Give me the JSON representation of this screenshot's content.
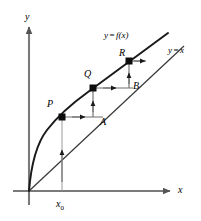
{
  "figure": {
    "background": "#ffffff",
    "stroke": "#1a1a1a",
    "axis_color": "#7a7a7a",
    "width": 201,
    "height": 221
  },
  "axes": {
    "x_label": "x",
    "y_label": "y",
    "origin": {
      "x": 29,
      "y": 191
    },
    "x_axis_end": {
      "x": 176,
      "y": 191
    },
    "y_axis_end": {
      "x": 29,
      "y": 23
    }
  },
  "curves": [
    {
      "name": "function-curve",
      "label": "y = f(x)",
      "label_lhs": "y",
      "label_eq": "=",
      "label_rhs": "f(x)",
      "label_pos": {
        "x": 104,
        "y": 31
      }
    },
    {
      "name": "identity-line",
      "label": "y = x",
      "label_lhs": "y",
      "label_eq": "=",
      "label_rhs": "x",
      "label_pos": {
        "x": 168,
        "y": 46
      }
    }
  ],
  "points": [
    {
      "id": "P",
      "label": "P",
      "dot": {
        "x": 62,
        "y": 117
      },
      "label_pos": {
        "x": 47,
        "y": 99
      }
    },
    {
      "id": "Q",
      "label": "Q",
      "dot": {
        "x": 93,
        "y": 88
      },
      "label_pos": {
        "x": 84,
        "y": 69
      }
    },
    {
      "id": "R",
      "label": "R",
      "dot": {
        "x": 129,
        "y": 61
      },
      "label_pos": {
        "x": 119,
        "y": 48
      }
    },
    {
      "id": "A",
      "label": "A",
      "dot": null,
      "label_pos": {
        "x": 100,
        "y": 117
      }
    },
    {
      "id": "B",
      "label": "B",
      "dot": null,
      "label_pos": {
        "x": 133,
        "y": 81
      }
    }
  ],
  "ticks": [
    {
      "id": "x0",
      "label": "x",
      "subscript": "0",
      "pos": {
        "x": 56,
        "y": 199
      },
      "gridline_x": 62
    }
  ],
  "iteration": {
    "description": "Vertical arrows to the curve, horizontal arrows to the line y = x",
    "segments": [
      {
        "from": "x0-axis",
        "to": "P",
        "direction": "up"
      },
      {
        "from": "P",
        "to": "A",
        "direction": "right"
      },
      {
        "from": "A",
        "to": "Q",
        "direction": "up"
      },
      {
        "from": "Q",
        "to": "B",
        "direction": "right"
      },
      {
        "from": "B",
        "to": "R",
        "direction": "up"
      }
    ]
  }
}
